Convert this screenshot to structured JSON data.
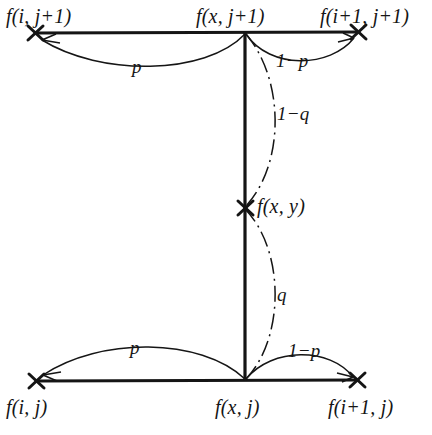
{
  "figure": {
    "type": "bilinear-interpolation-diagram",
    "background_color": "#ffffff",
    "stroke_color": "#151515",
    "nodes": [
      {
        "id": "top-left",
        "label": "f(i, j+1)",
        "x": 35,
        "y": 33,
        "marker": "x-cross"
      },
      {
        "id": "top-center",
        "label": "f(x, j+1)",
        "x": 245,
        "y": 32,
        "marker": "none"
      },
      {
        "id": "top-right",
        "label": "f(i+1, j+1)",
        "x": 358,
        "y": 32,
        "marker": "x-cross"
      },
      {
        "id": "center",
        "label": "f(x, y)",
        "x": 245,
        "y": 208,
        "marker": "x-cross"
      },
      {
        "id": "bottom-left",
        "label": "f(i, j)",
        "x": 36,
        "y": 381,
        "marker": "x-cross"
      },
      {
        "id": "bottom-center",
        "label": "f(x, j)",
        "x": 245,
        "y": 381,
        "marker": "none"
      },
      {
        "id": "bottom-right",
        "label": "f(i+1, j)",
        "x": 357,
        "y": 380,
        "marker": "x-cross"
      }
    ],
    "edges": [
      {
        "id": "top-horizontal",
        "from": "top-left",
        "to": "top-right",
        "style": "solid"
      },
      {
        "id": "bottom-horizontal",
        "from": "bottom-left",
        "to": "bottom-right",
        "style": "solid"
      },
      {
        "id": "vertical",
        "from": "top-center",
        "to": "bottom-center",
        "style": "solid"
      }
    ],
    "weights": [
      {
        "id": "top-left-weight",
        "text": "p",
        "arc": "top-center-to-top-left",
        "style": "solid-arc-arrow"
      },
      {
        "id": "top-right-weight",
        "text": "1−p",
        "arc": "top-center-to-top-right",
        "style": "solid-arc-arrow"
      },
      {
        "id": "upper-vertical-weight",
        "text": "1−q",
        "arc": "top-center-to-center",
        "style": "dash-dot-arc"
      },
      {
        "id": "lower-vertical-weight",
        "text": "q",
        "arc": "center-to-bottom-center",
        "style": "dash-dot-arc"
      },
      {
        "id": "bottom-left-weight",
        "text": "p",
        "arc": "bottom-center-to-bottom-left",
        "style": "solid-arc-arrow"
      },
      {
        "id": "bottom-right-weight",
        "text": "1−p",
        "arc": "bottom-center-to-bottom-right",
        "style": "solid-arc-arrow"
      }
    ]
  }
}
